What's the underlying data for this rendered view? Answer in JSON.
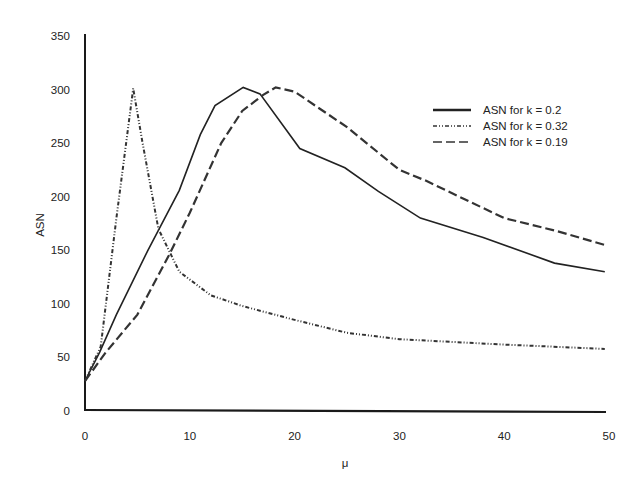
{
  "chart_data": {
    "type": "line",
    "title": "",
    "xlabel": "μ",
    "ylabel": "ASN",
    "xlim": [
      0,
      50
    ],
    "ylim": [
      0,
      350
    ],
    "xticks": [
      0,
      10,
      20,
      30,
      40,
      50
    ],
    "yticks": [
      0,
      50,
      100,
      150,
      200,
      250,
      300,
      350
    ],
    "grid": false,
    "legend_position": "upper right",
    "series": [
      {
        "name": "ASN for k = 0.2",
        "style": "solid",
        "x": [
          0,
          1.4,
          3,
          6,
          9,
          11,
          12.4,
          15.1,
          16.7,
          20.5,
          24.8,
          28,
          32,
          38,
          44.8,
          49.6
        ],
        "y": [
          28,
          55,
          90,
          150,
          206,
          258,
          285,
          302,
          296,
          245,
          227,
          205,
          180,
          162,
          138,
          130
        ]
      },
      {
        "name": "ASN for k = 0.32",
        "style": "dash-dot-dot",
        "x": [
          0,
          1.5,
          3,
          4.6,
          5.5,
          7,
          9,
          12,
          15,
          20,
          25,
          30,
          40,
          49.6
        ],
        "y": [
          28,
          60,
          180,
          301,
          250,
          170,
          130,
          108,
          98,
          85,
          73,
          67,
          62,
          58
        ]
      },
      {
        "name": "ASN for k = 0.19",
        "style": "dashed",
        "x": [
          0,
          2,
          5,
          8,
          10,
          13,
          15,
          17,
          18.2,
          20,
          25,
          30,
          32.5,
          40,
          45,
          49.6
        ],
        "y": [
          28,
          55,
          90,
          145,
          185,
          250,
          280,
          295,
          302,
          298,
          265,
          225,
          215,
          180,
          168,
          155
        ]
      }
    ]
  },
  "legend": {
    "items": [
      {
        "label": "ASN for k = 0.2"
      },
      {
        "label": "ASN for k = 0.32"
      },
      {
        "label": "ASN for k = 0.19"
      }
    ]
  },
  "axes": {
    "x_label": "μ",
    "y_label": "ASN",
    "x_ticks": [
      "0",
      "10",
      "20",
      "30",
      "40",
      "50"
    ],
    "y_ticks": [
      "0",
      "50",
      "100",
      "150",
      "200",
      "250",
      "300",
      "350"
    ]
  }
}
